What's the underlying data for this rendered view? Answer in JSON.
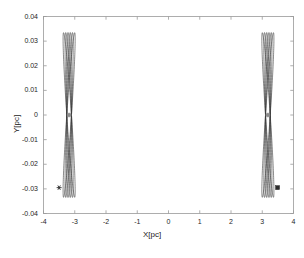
{
  "chart_data": {
    "type": "line",
    "title": "",
    "xlabel": "X[pc]",
    "ylabel": "Y[pc]",
    "xlim": [
      -4,
      4
    ],
    "ylim": [
      -0.04,
      0.04
    ],
    "xticks": [
      -4,
      -3,
      -2,
      -1,
      0,
      1,
      2,
      3,
      4
    ],
    "xticklabels": [
      "-4",
      "-3",
      "-2",
      "-1",
      "0",
      "1",
      "2",
      "3",
      "4"
    ],
    "yticks": [
      -0.04,
      -0.03,
      -0.02,
      -0.01,
      0,
      0.01,
      0.02,
      0.03,
      0.04
    ],
    "yticklabels": [
      "-0.04",
      "-0.03",
      "-0.02",
      "-0.01",
      "0",
      "0.01",
      "0.02",
      "0.03",
      "0.04"
    ],
    "grid": false,
    "legend": false,
    "tick_direction": "in",
    "line_color": "#3a3a3a",
    "line_width": 0.6,
    "series": [
      {
        "name": "left-orbit-bundle",
        "description": "precessing elongated orbit loops about x = -3.18 pc",
        "center_x": -3.18,
        "center_y": 0.0,
        "semi_major_y": 0.0335,
        "semi_minor_x": 0.075,
        "loop_count": 6,
        "precession_step_deg": 1.55
      },
      {
        "name": "right-orbit-bundle",
        "description": "precessing elongated orbit loops about x = 3.18 pc",
        "center_x": 3.18,
        "center_y": 0.0,
        "semi_major_y": 0.0335,
        "semi_minor_x": 0.075,
        "loop_count": 6,
        "precession_step_deg": 1.55
      }
    ],
    "markers": [
      {
        "name": "left-center-dot",
        "shape": "circle",
        "x": -3.18,
        "y": 0.0,
        "color": "#8c8c8c",
        "size": 4
      },
      {
        "name": "right-center-dot",
        "shape": "circle",
        "x": 3.18,
        "y": 0.0,
        "color": "#8c8c8c",
        "size": 4
      },
      {
        "name": "left-start-asterisk",
        "shape": "asterisk",
        "x": -3.5,
        "y": -0.0295,
        "color": "#2b2b2b",
        "size": 5
      },
      {
        "name": "right-start-square",
        "shape": "square",
        "x": 3.49,
        "y": -0.0295,
        "color": "#2b2b2b",
        "size": 4
      }
    ],
    "axes_color": "#9a9a9a",
    "background": "#ffffff"
  }
}
